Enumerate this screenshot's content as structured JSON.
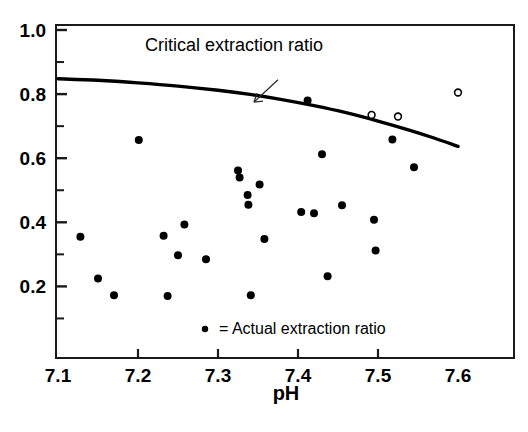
{
  "chart_data": {
    "type": "scatter",
    "title": "",
    "xlabel": "pH",
    "ylabel": "",
    "xlim": [
      7.1,
      7.6
    ],
    "ylim": [
      0.0,
      1.0
    ],
    "grid": false,
    "legend_position": "inside-bottom-center",
    "x_ticks": [
      "7.1",
      "7.2",
      "7.3",
      "7.4",
      "7.5",
      "7.6"
    ],
    "x_tick_values": [
      7.1,
      7.2,
      7.3,
      7.4,
      7.5,
      7.6
    ],
    "y_ticks": [
      "1.0",
      "0.8",
      "0.6",
      "0.4",
      "0.2"
    ],
    "y_tick_values": [
      1.0,
      0.8,
      0.6,
      0.4,
      0.2
    ],
    "y_minor_tick_values": [
      0.9,
      0.7,
      0.5,
      0.3,
      0.1
    ],
    "annotations": [
      {
        "name": "critical-extraction-ratio-label",
        "text": "Critical extraction ratio",
        "x": 7.32,
        "y": 0.935
      },
      {
        "name": "pointer-arrow",
        "text": "",
        "from_x": 7.375,
        "from_y": 0.845,
        "to_x": 7.345,
        "to_y": 0.775
      }
    ],
    "legend": [
      {
        "marker": "filled-circle",
        "symbol": "•",
        "text": "= Actual extraction ratio"
      }
    ],
    "series": [
      {
        "name": "Critical extraction ratio",
        "type": "line",
        "marker": "none",
        "color": "#000000",
        "points": [
          {
            "x": 7.1,
            "y": 0.848
          },
          {
            "x": 7.15,
            "y": 0.843
          },
          {
            "x": 7.2,
            "y": 0.835
          },
          {
            "x": 7.25,
            "y": 0.825
          },
          {
            "x": 7.3,
            "y": 0.812
          },
          {
            "x": 7.34,
            "y": 0.799
          },
          {
            "x": 7.38,
            "y": 0.783
          },
          {
            "x": 7.42,
            "y": 0.764
          },
          {
            "x": 7.46,
            "y": 0.742
          },
          {
            "x": 7.5,
            "y": 0.716
          },
          {
            "x": 7.54,
            "y": 0.687
          },
          {
            "x": 7.57,
            "y": 0.663
          },
          {
            "x": 7.6,
            "y": 0.637
          }
        ]
      },
      {
        "name": "Actual extraction ratio",
        "type": "scatter",
        "marker": "filled-circle",
        "color": "#000000",
        "points": [
          {
            "x": 7.128,
            "y": 0.355
          },
          {
            "x": 7.15,
            "y": 0.225
          },
          {
            "x": 7.17,
            "y": 0.172
          },
          {
            "x": 7.201,
            "y": 0.657
          },
          {
            "x": 7.232,
            "y": 0.358
          },
          {
            "x": 7.237,
            "y": 0.17
          },
          {
            "x": 7.25,
            "y": 0.297
          },
          {
            "x": 7.258,
            "y": 0.393
          },
          {
            "x": 7.285,
            "y": 0.285
          },
          {
            "x": 7.325,
            "y": 0.562
          },
          {
            "x": 7.327,
            "y": 0.54
          },
          {
            "x": 7.337,
            "y": 0.485
          },
          {
            "x": 7.338,
            "y": 0.455
          },
          {
            "x": 7.341,
            "y": 0.172
          },
          {
            "x": 7.352,
            "y": 0.518
          },
          {
            "x": 7.358,
            "y": 0.348
          },
          {
            "x": 7.404,
            "y": 0.432
          },
          {
            "x": 7.412,
            "y": 0.78
          },
          {
            "x": 7.42,
            "y": 0.428
          },
          {
            "x": 7.43,
            "y": 0.612
          },
          {
            "x": 7.437,
            "y": 0.232
          },
          {
            "x": 7.455,
            "y": 0.453
          },
          {
            "x": 7.495,
            "y": 0.408
          },
          {
            "x": 7.497,
            "y": 0.312
          },
          {
            "x": 7.518,
            "y": 0.658
          },
          {
            "x": 7.545,
            "y": 0.572
          }
        ]
      },
      {
        "name": "Open circle observations",
        "type": "scatter",
        "marker": "open-circle",
        "color": "#000000",
        "points": [
          {
            "x": 7.492,
            "y": 0.735
          },
          {
            "x": 7.525,
            "y": 0.73
          },
          {
            "x": 7.6,
            "y": 0.805
          }
        ]
      }
    ]
  }
}
